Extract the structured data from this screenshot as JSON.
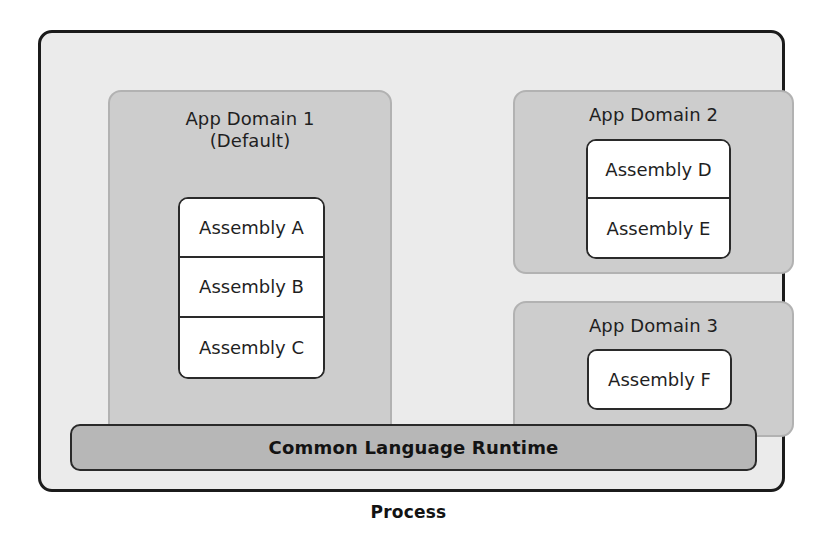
{
  "diagram": {
    "caption": "Process",
    "colors": {
      "page_background": "#ffffff",
      "process_fill": "#ebebeb",
      "process_border": "#1b1b1b",
      "domain_fill": "#cdcdcd",
      "domain_border": "#b2b2b2",
      "assembly_fill": "#ffffff",
      "assembly_border": "#2a2a2a",
      "runtime_fill": "#b7b7b7",
      "text": "#1f1f1f"
    },
    "process": {
      "name": "Process",
      "runtime": {
        "label": "Common Language Runtime"
      },
      "domains": [
        {
          "id": "domain-1",
          "title_line_1": "App Domain 1",
          "title_line_2": "(Default)",
          "assemblies": [
            {
              "label": "Assembly A"
            },
            {
              "label": "Assembly B"
            },
            {
              "label": "Assembly C"
            }
          ]
        },
        {
          "id": "domain-2",
          "title_line_1": "App Domain 2",
          "title_line_2": "",
          "assemblies": [
            {
              "label": "Assembly D"
            },
            {
              "label": "Assembly E"
            }
          ]
        },
        {
          "id": "domain-3",
          "title_line_1": "App Domain 3",
          "title_line_2": "",
          "assemblies": [
            {
              "label": "Assembly F"
            }
          ]
        }
      ]
    }
  }
}
